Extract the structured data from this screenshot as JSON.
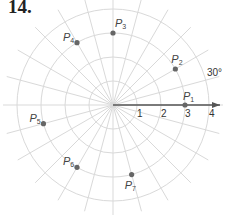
{
  "problem_number": "14.",
  "polar_grid": {
    "ring_labels": [
      "1",
      "2",
      "3",
      "4"
    ],
    "angle_label": "30°",
    "angle_step_degrees": 15
  },
  "points": [
    {
      "name": "P",
      "sub": "1",
      "r": 3,
      "theta_deg": 0
    },
    {
      "name": "P",
      "sub": "2",
      "r": 3,
      "theta_deg": 30
    },
    {
      "name": "P",
      "sub": "3",
      "r": 3,
      "theta_deg": 90
    },
    {
      "name": "P",
      "sub": "4",
      "r": 3,
      "theta_deg": 120
    },
    {
      "name": "P",
      "sub": "5",
      "r": 3,
      "theta_deg": 195
    },
    {
      "name": "P",
      "sub": "6",
      "r": 3,
      "theta_deg": 240
    },
    {
      "name": "P",
      "sub": "7",
      "r": 3,
      "theta_deg": 285
    }
  ]
}
